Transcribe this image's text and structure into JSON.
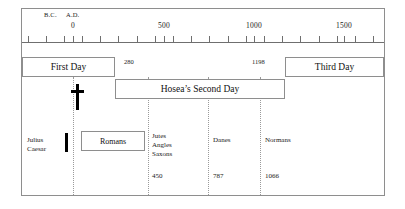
{
  "chart_data": {
    "type": "table",
    "axis": {
      "label_left_era": "B.C.",
      "label_right_era": "A.D.",
      "tick_labels": [
        "0",
        "500",
        "1000",
        "1500"
      ],
      "tick_values": [
        0,
        500,
        1000,
        1500
      ],
      "tick_interval_years": 100,
      "range": [
        -200,
        1700
      ],
      "tick_count": 20,
      "grid": false
    },
    "day_bands": [
      {
        "label": "First Day",
        "start": null,
        "end": 280
      },
      {
        "label": "Hosea's Second Day",
        "start": 280,
        "end": 1198
      },
      {
        "label": "Third Day",
        "start": 1198,
        "end": null
      }
    ],
    "boundary_dates": [
      "280",
      "1198"
    ],
    "peoples": [
      {
        "label": "Julius\nCaesar",
        "date": null
      },
      {
        "label": "Romans",
        "date": null
      },
      {
        "label": "Jutes\nAngles\nSaxons",
        "date": "450"
      },
      {
        "label": "Danes",
        "date": "787"
      },
      {
        "label": "Normans",
        "date": "1066"
      }
    ],
    "era_dates": [
      "450",
      "787",
      "1066"
    ],
    "symbols": [
      {
        "name": "cross",
        "glyph": "†"
      }
    ]
  },
  "axis": {
    "era_bc": "B.C.",
    "era_ad": "A.D.",
    "ticks": [
      {
        "label": "0",
        "x": 73
      },
      {
        "label": "500",
        "x": 164
      },
      {
        "label": "1000",
        "x": 254
      },
      {
        "label": "1500",
        "x": 344
      }
    ],
    "tick_positions": [
      28,
      46,
      64,
      73,
      82,
      100,
      118,
      137,
      155,
      164,
      173,
      191,
      209,
      228,
      246,
      254,
      264,
      282,
      300,
      319,
      337,
      344,
      355,
      373
    ]
  },
  "bands": {
    "first_day": "First Day",
    "second_day": "Hosea’s Second Day",
    "third_day": "Third Day",
    "date_start": "280",
    "date_end": "1198"
  },
  "peoples": {
    "julius_caesar": "Julius\nCaesar",
    "romans": "Romans",
    "jutes_angles_saxons": "Jutes\nAngles\nSaxons",
    "danes": "Danes",
    "normans": "Normans"
  },
  "dates": {
    "saxons": "450",
    "danes": "787",
    "normans": "1066"
  },
  "dividers": [
    73,
    148,
    208,
    260
  ],
  "colors": {
    "border": "#8e8e8e",
    "axis": "#6f6f6f",
    "dotted": "#9a9a9a",
    "text": "#111111",
    "symbol": "#000000",
    "background": "#ffffff"
  }
}
